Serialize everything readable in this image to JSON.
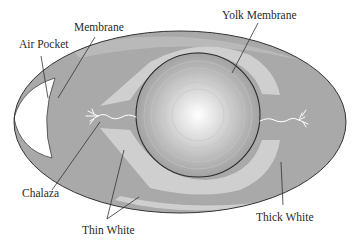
{
  "diagram": {
    "colors": {
      "background": "#ffffff",
      "thick_white": "#a9a9a9",
      "thin_white": "#cfcfcf",
      "air_pocket": "#ffffff",
      "yolk_center": "#ffffff",
      "yolk_edge": "#a0a0a0",
      "outline": "#333333",
      "leader_line": "#333333",
      "chalaza": "#ffffff"
    },
    "labels": {
      "air_pocket": "Air Pocket",
      "membrane": "Membrane",
      "yolk_membrane": "Yolk Membrane",
      "chalaza": "Chalaza",
      "thin_white": "Thin White",
      "thick_white": "Thick White"
    }
  }
}
